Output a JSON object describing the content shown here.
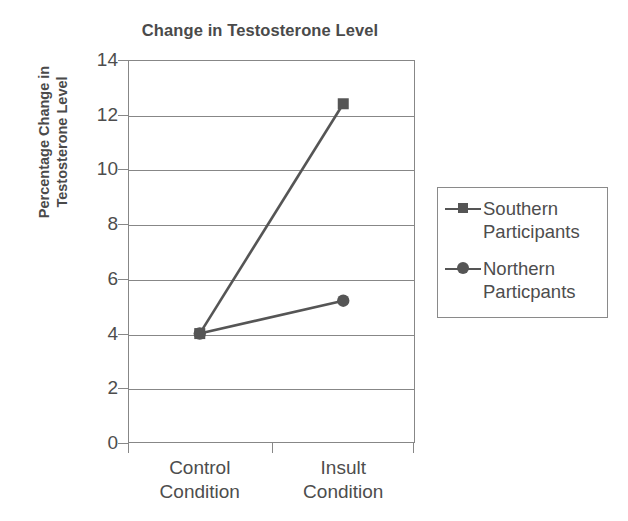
{
  "chart_data": {
    "type": "line",
    "title": "Change in Testosterone Level",
    "xlabel": "",
    "ylabel": "Percentage Change in Testosterone Level",
    "ylabel_line1": "Percentage Change in",
    "ylabel_line2": "Testosterone Level",
    "categories": [
      "Control Condition",
      "Insult Condition"
    ],
    "category_lines": [
      {
        "w1": "Control",
        "w2": "Condition"
      },
      {
        "w1": "Insult",
        "w2": "Condition"
      }
    ],
    "series": [
      {
        "name": "Southern Participants",
        "marker": "square",
        "values": [
          4.0,
          12.4
        ],
        "color": "#555555"
      },
      {
        "name": "Northern Particpants",
        "marker": "circle",
        "values": [
          4.0,
          5.2
        ],
        "color": "#555555"
      }
    ],
    "ylim": [
      0,
      14
    ],
    "ytick_values": [
      14,
      12,
      10,
      8,
      6,
      4,
      2,
      0
    ],
    "ytick_labels": [
      "14",
      "12",
      "10",
      "8",
      "6",
      "4",
      "2",
      "0"
    ],
    "grid": "horizontal",
    "legend_position": "right",
    "legend": [
      {
        "label_line1": "Southern",
        "label_line2": "Participants",
        "marker": "square"
      },
      {
        "label_line1": "Northern",
        "label_line2": "Particpants",
        "marker": "circle"
      }
    ],
    "axis_color": "#878787",
    "text_color": "#4d4d4d"
  }
}
